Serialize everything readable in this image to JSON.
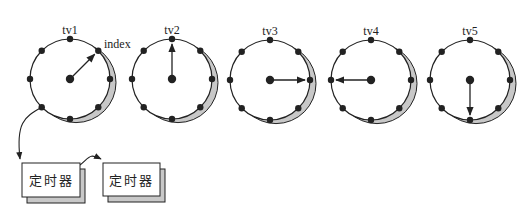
{
  "wheels": [
    {
      "id": "tv1",
      "label": "tv1",
      "cx": 70,
      "cy": 79,
      "r": 40,
      "pointer_deg": -45,
      "pointer_desc": "upper-right"
    },
    {
      "id": "tv2",
      "label": "tv2",
      "cx": 172,
      "cy": 79,
      "r": 40,
      "pointer_deg": -90,
      "pointer_desc": "up"
    },
    {
      "id": "tv3",
      "label": "tv3",
      "cx": 270,
      "cy": 80,
      "r": 40,
      "pointer_deg": 0,
      "pointer_desc": "right"
    },
    {
      "id": "tv4",
      "label": "tv4",
      "cx": 371,
      "cy": 80,
      "r": 40,
      "pointer_deg": 180,
      "pointer_desc": "left"
    },
    {
      "id": "tv5",
      "label": "tv5",
      "cx": 470,
      "cy": 80,
      "r": 40,
      "pointer_deg": 90,
      "pointer_desc": "down"
    }
  ],
  "slots_per_wheel": 8,
  "index_label": "index",
  "timers": [
    {
      "label": "定时器",
      "x": 22,
      "y": 163,
      "w": 58,
      "h": 34
    },
    {
      "label": "定时器",
      "x": 103,
      "y": 163,
      "w": 57,
      "h": 33
    }
  ],
  "colors": {
    "stroke": "#222222",
    "shadow": "#c8c8c8",
    "fill": "#ffffff"
  }
}
